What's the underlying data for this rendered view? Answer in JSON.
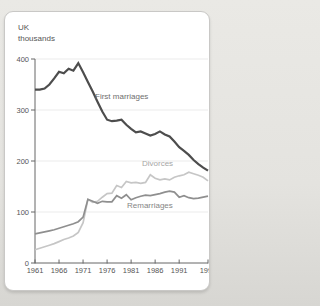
{
  "page": {
    "background_top": "#eae9e5",
    "background_bottom": "#d7d6d2"
  },
  "card": {
    "background": "#ffffff",
    "border_color": "#c9c8c6"
  },
  "chart_data": {
    "type": "line",
    "unit_label": {
      "line1": "UK",
      "line2": "thousands"
    },
    "xlim": [
      1961,
      1997
    ],
    "ylim": [
      0,
      400
    ],
    "x_ticks": [
      1961,
      1966,
      1971,
      1976,
      1981,
      1986,
      1991,
      1997
    ],
    "y_ticks": [
      0,
      100,
      200,
      300,
      400
    ],
    "grid": "horizontal-light",
    "legend": "inline-labels",
    "axis_color": "#666666",
    "grid_color": "#ebebeb",
    "tick_label_color": "#555555",
    "x": [
      1961,
      1962,
      1963,
      1964,
      1965,
      1966,
      1967,
      1968,
      1969,
      1970,
      1971,
      1972,
      1973,
      1974,
      1975,
      1976,
      1977,
      1978,
      1979,
      1980,
      1981,
      1982,
      1983,
      1984,
      1985,
      1986,
      1987,
      1988,
      1989,
      1990,
      1991,
      1992,
      1993,
      1994,
      1995,
      1996,
      1997
    ],
    "series": [
      {
        "name": "First marriages",
        "color": "#4d4d4d",
        "label_color": "#6e6e6e",
        "values": [
          340,
          340,
          342,
          350,
          362,
          375,
          372,
          381,
          377,
          392,
          374,
          355,
          336,
          316,
          297,
          281,
          278,
          279,
          281,
          271,
          263,
          256,
          258,
          254,
          250,
          253,
          258,
          252,
          248,
          238,
          227,
          220,
          212,
          202,
          194,
          187,
          181
        ]
      },
      {
        "name": "Divorces",
        "color": "#c6c6c6",
        "label_color": "#a6a6a6",
        "values": [
          26,
          29,
          32,
          35,
          38,
          42,
          46,
          49,
          53,
          60,
          79,
          125,
          119,
          121,
          129,
          136,
          137,
          152,
          148,
          160,
          157,
          158,
          156,
          158,
          173,
          166,
          163,
          165,
          163,
          168,
          171,
          173,
          178,
          175,
          172,
          168,
          161
        ]
      },
      {
        "name": "Remarriages",
        "color": "#8f8f8f",
        "label_color": "#858585",
        "values": [
          57,
          59,
          61,
          63,
          65,
          68,
          71,
          74,
          77,
          81,
          90,
          125,
          121,
          117,
          121,
          120,
          120,
          132,
          127,
          134,
          124,
          128,
          131,
          133,
          132,
          134,
          136,
          139,
          141,
          139,
          129,
          132,
          128,
          126,
          127,
          129,
          131
        ]
      }
    ]
  }
}
